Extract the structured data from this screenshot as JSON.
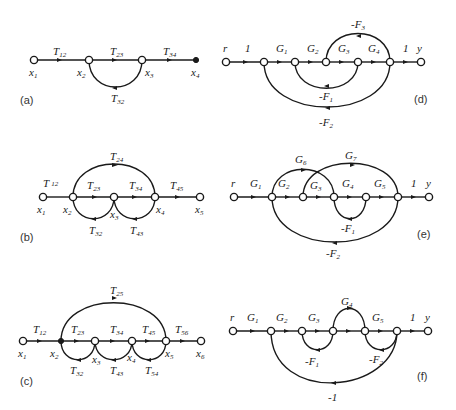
{
  "figure": {
    "panels": [
      {
        "id": "a",
        "label": "(a)",
        "gains": [
          "T12",
          "T23",
          "T34",
          "T32"
        ],
        "nodes": [
          "x1",
          "x2",
          "x3",
          "x4"
        ]
      },
      {
        "id": "b",
        "label": "(b)",
        "gains": [
          "T12",
          "T23",
          "T34",
          "T45",
          "T24",
          "T32",
          "T43"
        ],
        "nodes": [
          "x1",
          "x2",
          "x3",
          "x4",
          "x5"
        ]
      },
      {
        "id": "c",
        "label": "(c)",
        "gains": [
          "T12",
          "T23",
          "T34",
          "T45",
          "T56",
          "T25",
          "T32",
          "T43",
          "T54"
        ],
        "nodes": [
          "x1",
          "x2",
          "x3",
          "x4",
          "x5",
          "x6"
        ]
      },
      {
        "id": "d",
        "label": "(d)",
        "gains": [
          "1",
          "G1",
          "G2",
          "G3",
          "G4",
          "1",
          "-F3",
          "-F1",
          "-F2"
        ],
        "nodes": [
          "r",
          "y"
        ]
      },
      {
        "id": "e",
        "label": "(e)",
        "gains": [
          "G1",
          "G2",
          "G3",
          "G4",
          "G5",
          "1",
          "G6",
          "G7",
          "-F1",
          "-F2"
        ],
        "nodes": [
          "r",
          "y"
        ]
      },
      {
        "id": "f",
        "label": "(f)",
        "gains": [
          "G1",
          "G2",
          "G3",
          "G4",
          "G5",
          "1",
          "-F1",
          "-F2",
          "-1"
        ],
        "nodes": [
          "r",
          "y"
        ]
      }
    ]
  },
  "a": {
    "panel": "(a)",
    "T12": "T",
    "T12s": "12",
    "T23": "T",
    "T23s": "23",
    "T34": "T",
    "T34s": "34",
    "T32": "T",
    "T32s": "32",
    "x1": "x",
    "x1s": "1",
    "x2": "x",
    "x2s": "2",
    "x3": "x",
    "x3s": "3",
    "x4": "x",
    "x4s": "4"
  },
  "b": {
    "panel": "(b)",
    "T12": "T",
    "T12s": "12",
    "T23": "T",
    "T23s": "23",
    "T34": "T",
    "T34s": "34",
    "T45": "T",
    "T45s": "45",
    "T24": "T",
    "T24s": "24",
    "T32": "T",
    "T32s": "32",
    "T43": "T",
    "T43s": "43",
    "x1": "x",
    "x1s": "1",
    "x2": "x",
    "x2s": "2",
    "x3": "x",
    "x3s": "3",
    "x4": "x",
    "x4s": "4",
    "x5": "x",
    "x5s": "5"
  },
  "c": {
    "panel": "(c)",
    "T12": "T",
    "T12s": "12",
    "T23": "T",
    "T23s": "23",
    "T34": "T",
    "T34s": "34",
    "T45": "T",
    "T45s": "45",
    "T56": "T",
    "T56s": "56",
    "T25": "T",
    "T25s": "25",
    "T32": "T",
    "T32s": "32",
    "T43": "T",
    "T43s": "43",
    "T54": "T",
    "T54s": "54",
    "x1": "x",
    "x1s": "1",
    "x2": "x",
    "x2s": "2",
    "x3": "x",
    "x3s": "3",
    "x4": "x",
    "x4s": "4",
    "x5": "x",
    "x5s": "5",
    "x6": "x",
    "x6s": "6"
  },
  "d": {
    "panel": "(d)",
    "r": "r",
    "y": "y",
    "one_a": "1",
    "one_b": "1",
    "G1": "G",
    "G1s": "1",
    "G2": "G",
    "G2s": "2",
    "G3": "G",
    "G3s": "3",
    "G4": "G",
    "G4s": "4",
    "F3": "-F",
    "F3s": "3",
    "F1": "-F",
    "F1s": "1",
    "F2": "-F",
    "F2s": "2"
  },
  "e": {
    "panel": "(e)",
    "r": "r",
    "y": "y",
    "one": "1",
    "G1": "G",
    "G1s": "1",
    "G2": "G",
    "G2s": "2",
    "G3": "G",
    "G3s": "3",
    "G4": "G",
    "G4s": "4",
    "G5": "G",
    "G5s": "5",
    "G6": "G",
    "G6s": "6",
    "G7": "G",
    "G7s": "7",
    "F1": "-F",
    "F1s": "1",
    "F2": "-F",
    "F2s": "2"
  },
  "f": {
    "panel": "(f)",
    "r": "r",
    "y": "y",
    "one": "1",
    "G1": "G",
    "G1s": "1",
    "G2": "G",
    "G2s": "2",
    "G3": "G",
    "G3s": "3",
    "G4": "G",
    "G4s": "4",
    "G5": "G",
    "G5s": "5",
    "F1": "-F",
    "F1s": "1",
    "F2": "-F",
    "F2s": "2",
    "neg1": "-1"
  }
}
